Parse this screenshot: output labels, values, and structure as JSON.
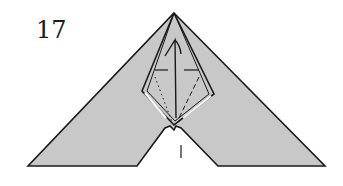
{
  "diagram": {
    "type": "origami-fold-diagram",
    "step_number": "17",
    "colors": {
      "paper_shaded": "#c8c8c8",
      "line": "#1a1a1a",
      "background": "#ffffff"
    },
    "elements": [
      "outer-triangle-shape",
      "inner-kite-flap",
      "valley-fold-dashed-lines",
      "mountain-fold-dotted-lines",
      "center-arrow",
      "center-crease-mark"
    ]
  }
}
